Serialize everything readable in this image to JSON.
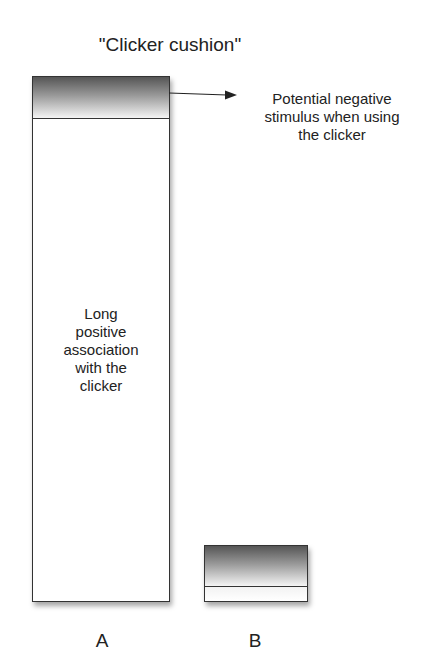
{
  "title": "\"Clicker cushion\"",
  "bars": [
    {
      "label": "A",
      "inner_text_lines": [
        "Long",
        "positive",
        "association",
        "with the",
        "clicker"
      ],
      "cushion_relative": "small top portion"
    },
    {
      "label": "B",
      "cushion_relative": "most of the bar"
    }
  ],
  "annotation": {
    "lines": [
      "Potential negative",
      "stimulus when using",
      "the clicker"
    ],
    "icon": "arrow-right-icon"
  },
  "colors": {
    "outline": "#333333",
    "gradient_dark": "#555555",
    "gradient_light": "#f4f4f4"
  }
}
